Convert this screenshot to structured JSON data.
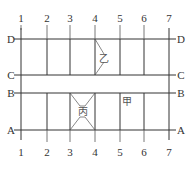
{
  "diagram": {
    "columns": [
      {
        "label": "1",
        "x": 21
      },
      {
        "label": "2",
        "x": 47
      },
      {
        "label": "3",
        "x": 70
      },
      {
        "label": "4",
        "x": 95
      },
      {
        "label": "5",
        "x": 120
      },
      {
        "label": "6",
        "x": 144
      },
      {
        "label": "7",
        "x": 169
      }
    ],
    "rows": [
      {
        "label": "D",
        "y": 39
      },
      {
        "label": "C",
        "y": 75
      },
      {
        "label": "B",
        "y": 93
      },
      {
        "label": "A",
        "y": 130
      }
    ],
    "regions": {
      "yi": {
        "label": "乙"
      },
      "bing": {
        "label": "丙"
      },
      "jia": {
        "label": "甲"
      }
    },
    "colors": {
      "line": "#333333",
      "text": "#333333"
    }
  }
}
